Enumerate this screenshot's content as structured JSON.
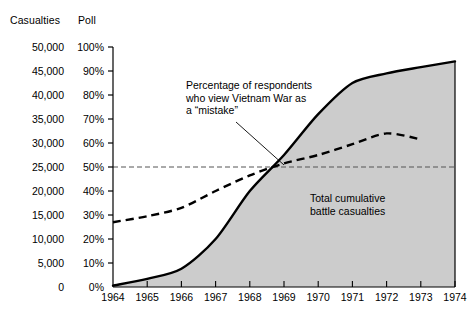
{
  "header": {
    "left_axis_title": "Casualties",
    "right_axis_title": "Poll"
  },
  "annotations": {
    "poll_line": "Percentage of respondents\nwho view Vietnam War as\na “mistake”",
    "area": "Total cumulative\nbattle casualties"
  },
  "chart_data": {
    "type": "line",
    "title": "",
    "xlabel": "",
    "ylabel": "Casualties",
    "y2label": "Poll",
    "grid": false,
    "legend": "none",
    "x": [
      1964,
      1965,
      1966,
      1967,
      1968,
      1969,
      1970,
      1971,
      1972,
      1973,
      1974
    ],
    "xlim": [
      1964,
      1974
    ],
    "xticklabels": [
      "1964",
      "1965",
      "1966",
      "1967",
      "1968",
      "1969",
      "1970",
      "1971",
      "1972",
      "1973",
      "1974"
    ],
    "ylim": [
      0,
      50000
    ],
    "yticks": [
      0,
      5000,
      10000,
      15000,
      20000,
      25000,
      30000,
      35000,
      40000,
      45000,
      50000
    ],
    "yticklabels": [
      "0",
      "5,000",
      "10,000",
      "15,000",
      "20,000",
      "25,000",
      "30,000",
      "35,000",
      "40,000",
      "45,000",
      "50,000"
    ],
    "y2lim": [
      0,
      100
    ],
    "y2ticks": [
      0,
      10,
      20,
      30,
      40,
      50,
      60,
      70,
      80,
      90,
      100
    ],
    "y2ticklabels": [
      "0%",
      "10%",
      "20%",
      "30%",
      "40%",
      "50%",
      "60%",
      "70%",
      "80%",
      "90%",
      "100%"
    ],
    "reference_line": {
      "value": 50,
      "axis": "poll",
      "style": "dashed",
      "label": "50%"
    },
    "series": [
      {
        "name": "Total cumulative battle casualties",
        "type": "area",
        "axis": "left",
        "style": "solid",
        "fill": "#cccccc",
        "x": [
          1964,
          1965,
          1966,
          1967,
          1968,
          1969,
          1970,
          1971,
          1972,
          1973,
          1974
        ],
        "values": [
          300,
          1700,
          3800,
          10000,
          20000,
          27500,
          36000,
          42500,
          44500,
          45800,
          47000
        ]
      },
      {
        "name": "Percentage of respondents who view Vietnam War as a \"mistake\"",
        "type": "line",
        "axis": "poll",
        "style": "dashed",
        "x": [
          1964,
          1965,
          1966,
          1967,
          1968,
          1969,
          1970,
          1971,
          1972,
          1973
        ],
        "values": [
          27,
          29.5,
          33,
          40,
          46.5,
          51.5,
          55,
          59.5,
          64,
          61.5
        ]
      }
    ],
    "colors": {
      "line": "#000000",
      "area_fill": "#cccccc",
      "axis": "#000000",
      "reference": "#555555"
    }
  }
}
